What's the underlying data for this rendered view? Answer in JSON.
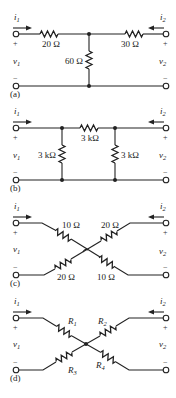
{
  "circuits": {
    "a": {
      "tag": "(a)",
      "i1": "i",
      "i1_sub": "1",
      "i2": "i",
      "i2_sub": "2",
      "v1": "v",
      "v1_sub": "1",
      "v2": "v",
      "v2_sub": "2",
      "plus": "+",
      "minus": "−",
      "r_left": "20 Ω",
      "r_right": "30 Ω",
      "r_shunt": "60 Ω"
    },
    "b": {
      "tag": "(b)",
      "i1": "i",
      "i1_sub": "1",
      "i2": "i",
      "i2_sub": "2",
      "v1": "v",
      "v1_sub": "1",
      "v2": "v",
      "v2_sub": "2",
      "plus": "+",
      "minus": "−",
      "r_series": "3 kΩ",
      "r_left_shunt": "3 kΩ",
      "r_right_shunt": "3 kΩ"
    },
    "c": {
      "tag": "(c)",
      "i1": "i",
      "i1_sub": "1",
      "i2": "i",
      "i2_sub": "2",
      "v1": "v",
      "v1_sub": "1",
      "v2": "v",
      "v2_sub": "2",
      "plus": "+",
      "minus": "−",
      "r_top_left": "10 Ω",
      "r_top_right": "20 Ω",
      "r_bottom_left": "20 Ω",
      "r_bottom_right": "10 Ω"
    },
    "d": {
      "tag": "(d)",
      "i1": "i",
      "i1_sub": "1",
      "i2": "i",
      "i2_sub": "2",
      "v1": "v",
      "v1_sub": "1",
      "v2": "v",
      "v2_sub": "2",
      "plus": "+",
      "minus": "−",
      "r1": "R",
      "r1_sub": "1",
      "r2": "R",
      "r2_sub": "2",
      "r3": "R",
      "r3_sub": "3",
      "r4": "R",
      "r4_sub": "4"
    }
  }
}
